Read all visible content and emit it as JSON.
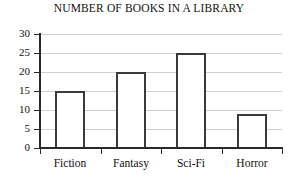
{
  "chart_data": {
    "type": "bar",
    "title": "NUMBER OF BOOKS IN A LIBRARY",
    "xlabel": "",
    "ylabel": "",
    "categories": [
      "Fiction",
      "Fantasy",
      "Sci-Fi",
      "Horror"
    ],
    "values": [
      15,
      20,
      25,
      9
    ],
    "ylim": [
      0,
      30
    ],
    "ytick_values": [
      0,
      5,
      10,
      15,
      20,
      25,
      30
    ],
    "ytick_labels": [
      "0",
      "5",
      "10",
      "15",
      "20",
      "25",
      "30"
    ],
    "grid": "horizontal",
    "legend": "none",
    "bar_fill_color": "#ffffff",
    "bar_edge_color": "#3a3a3a",
    "gridline_color": "#cfcfcf",
    "axis_color": "#2a2a2a",
    "background_color": "#ffffff"
  }
}
